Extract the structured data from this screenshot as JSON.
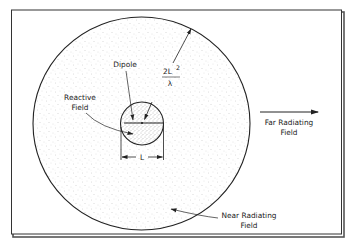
{
  "diagram": {
    "labels": {
      "dipole": "Dipole",
      "reactive_line1": "Reactive",
      "reactive_line2": "Field",
      "formula_numerator": "2L",
      "formula_exponent": "2",
      "formula_denominator": "λ",
      "far_line1": "Far Radiating",
      "far_line2": "Field",
      "near_line1": "Near Radiating",
      "near_line2": "Field",
      "dimension": "L"
    },
    "colors": {
      "stroke": "#222222",
      "frame": "#333333",
      "stipple_outer": "#bdbdbd",
      "stipple_inner": "#8a8a8a",
      "background": "#ffffff"
    },
    "regions": [
      {
        "name": "Reactive Field",
        "shape": "inner circle",
        "diameter_label": "L"
      },
      {
        "name": "Near Radiating Field",
        "shape": "outer circle",
        "radius_label": "2L²/λ"
      },
      {
        "name": "Far Radiating Field",
        "shape": "outside outer circle"
      }
    ]
  }
}
